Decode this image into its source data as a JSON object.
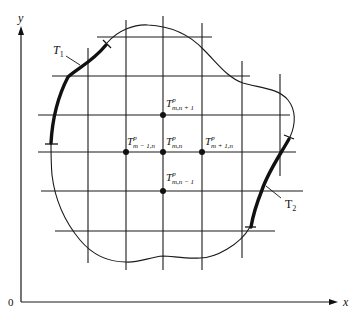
{
  "axes": {
    "x_label": "x",
    "y_label": "y",
    "origin_label": "0"
  },
  "boundary_conditions": [
    {
      "name": "T1",
      "base": "T",
      "sub": "1"
    },
    {
      "name": "T2",
      "base": "T",
      "sub": "2"
    }
  ],
  "nodes": {
    "center": {
      "base": "T",
      "sup": "p",
      "sub": "m,n"
    },
    "top": {
      "base": "T",
      "sup": "p",
      "sub": "m,n + 1"
    },
    "bottom": {
      "base": "T",
      "sup": "p",
      "sub": "m,n − 1"
    },
    "left": {
      "base": "T",
      "sup": "p",
      "sub": "m − 1,n"
    },
    "right": {
      "base": "T",
      "sup": "p",
      "sub": "m + 1,n"
    }
  },
  "colors": {
    "ink": "#111111",
    "background": "#ffffff"
  }
}
